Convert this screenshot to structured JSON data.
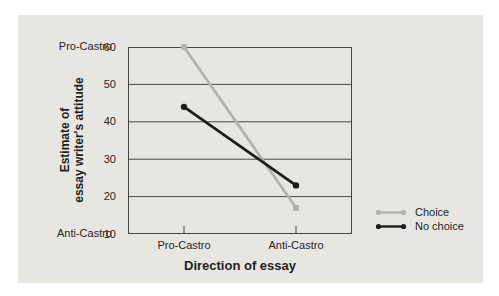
{
  "page": {
    "colors": {
      "page_background": "#ffffff",
      "panel_background": "#e8e6e1",
      "axis_color": "#474747",
      "text_color": "#262626"
    }
  },
  "chart_data": {
    "type": "line",
    "title": "",
    "xlabel": "Direction of essay",
    "ylabel": "Estimate of essay writer's attitude",
    "ylabel_lines": [
      "Estimate of",
      "essay writer's attitude"
    ],
    "categories": [
      "Pro-Castro",
      "Anti-Castro"
    ],
    "series": [
      {
        "name": "Choice",
        "values": [
          60,
          17
        ],
        "color": "#b3b2ae"
      },
      {
        "name": "No choice",
        "values": [
          44,
          23
        ],
        "color": "#1e1d1b"
      }
    ],
    "ylim": [
      10,
      60
    ],
    "yticks": [
      60,
      50,
      40,
      30,
      20,
      10
    ],
    "y_axis_annotations": {
      "top": "Pro-Castro",
      "bottom": "Anti-Castro"
    },
    "grid": "horizontal",
    "legend_position": "bottom-right",
    "marker": "circle"
  }
}
